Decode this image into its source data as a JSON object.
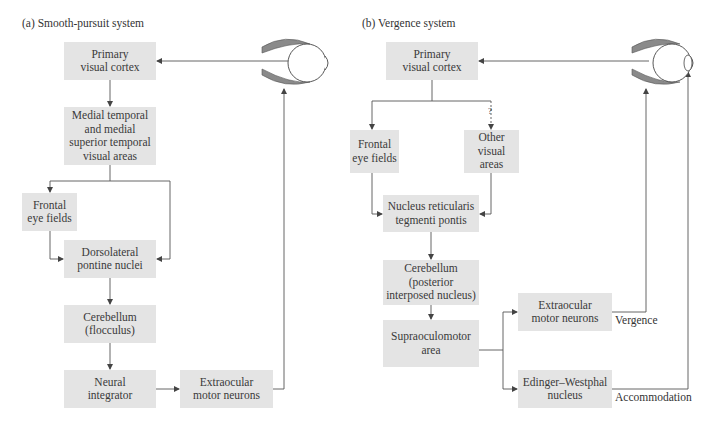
{
  "panels": [
    {
      "id": "a",
      "title": "(a)  Smooth-pursuit system",
      "nodes": {
        "primary_visual_cortex": "Primary\nvisual cortex",
        "mt_mst": "Medial temporal\nand medial\nsuperior temporal\nvisual areas",
        "frontal_eye_fields": "Frontal\neye fields",
        "dorsolateral_pontine": "Dorsolateral\npontine nuclei",
        "cerebellum": "Cerebellum\n(flocculus)",
        "neural_integrator": "Neural\nintegrator",
        "extraocular": "Extraocular\nmotor neurons"
      }
    },
    {
      "id": "b",
      "title": "(b)  Vergence system",
      "nodes": {
        "primary_visual_cortex": "Primary\nvisual cortex",
        "frontal_eye_fields": "Frontal\neye fields",
        "other_visual_areas": "Other\nvisual\nareas",
        "nucleus_reticularis": "Nucleus reticularis\ntegmenti pontis",
        "cerebellum": "Cerebellum\n(posterior\ninterposed nucleus)",
        "supraoculomotor": "Supraoculomotor\narea",
        "extraocular": "Extraocular\nmotor neurons",
        "edinger_westphal": "Edinger–Westphal\nnucleus"
      },
      "labels": {
        "uncertain_path": "?",
        "vergence": "Vergence",
        "accommodation": "Accommodation"
      }
    }
  ],
  "colors": {
    "box_fill": "#e4e4e4",
    "line": "#555555",
    "eye_muscle": "#8a8a8a"
  }
}
